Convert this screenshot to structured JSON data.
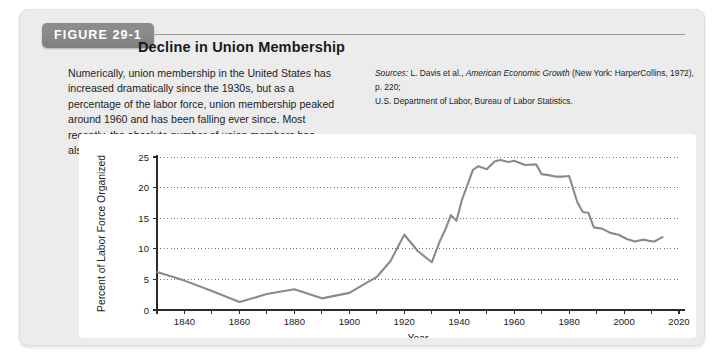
{
  "figure": {
    "tag": "FIGURE 29-1",
    "title": "Decline in Union Membership",
    "caption": "Numerically, union membership in the United States has increased dramatically since the 1930s, but as a percentage of the labor force, union membership peaked around 1960 and has been falling ever since. Most recently, the absolute number of union members has also diminished.",
    "sources_prefix": "Sources:",
    "sources_line1_a": " L. Davis et al., ",
    "sources_line1_italic": "American Economic Growth",
    "sources_line1_b": " (New York: HarperCollins, 1972), p. 220;",
    "sources_line2": "U.S. Department of Labor, Bureau of Labor Statistics."
  },
  "chart_data": {
    "type": "line",
    "title": "Decline in Union Membership",
    "xlabel": "Year",
    "ylabel": "Percent of Labor Force Organized",
    "xlim": [
      1830,
      2020
    ],
    "ylim": [
      0,
      25
    ],
    "xticks": [
      1830,
      1840,
      1850,
      1860,
      1870,
      1880,
      1890,
      1900,
      1910,
      1920,
      1930,
      1940,
      1950,
      1960,
      1970,
      1980,
      1990,
      2000,
      2010,
      2020
    ],
    "xticklabels": [
      "",
      "1840",
      "",
      "1860",
      "",
      "1880",
      "",
      "1900",
      "",
      "1920",
      "",
      "1940",
      "",
      "1960",
      "",
      "1980",
      "",
      "2000",
      "",
      "2020"
    ],
    "yticks": [
      0,
      5,
      10,
      15,
      20,
      25
    ],
    "yticklabels": [
      "0",
      "5",
      "10",
      "15",
      "20",
      "25"
    ],
    "grid": "horizontal-dotted",
    "legend": "none",
    "line_color": "#8a8a8a",
    "series": [
      {
        "name": "Percent of Labor Force Organized",
        "x": [
          1830,
          1840,
          1850,
          1860,
          1870,
          1880,
          1890,
          1900,
          1910,
          1915,
          1920,
          1925,
          1930,
          1933,
          1935,
          1937,
          1939,
          1941,
          1945,
          1947,
          1950,
          1953,
          1955,
          1958,
          1960,
          1964,
          1968,
          1970,
          1973,
          1975,
          1978,
          1980,
          1983,
          1985,
          1987,
          1989,
          1992,
          1995,
          1998,
          2001,
          2004,
          2007,
          2009,
          2011,
          2014
        ],
        "values": [
          6.2,
          4.8,
          3.1,
          1.3,
          2.6,
          3.4,
          1.9,
          2.8,
          5.4,
          8.0,
          12.3,
          9.6,
          7.8,
          11.3,
          13.2,
          15.5,
          14.6,
          18.0,
          22.9,
          23.5,
          23.0,
          24.3,
          24.5,
          24.2,
          24.4,
          23.7,
          23.8,
          22.2,
          22.0,
          21.8,
          21.8,
          21.9,
          17.6,
          16.0,
          15.9,
          13.5,
          13.3,
          12.6,
          12.3,
          11.6,
          11.2,
          11.5,
          11.3,
          11.2,
          11.9
        ]
      }
    ]
  }
}
